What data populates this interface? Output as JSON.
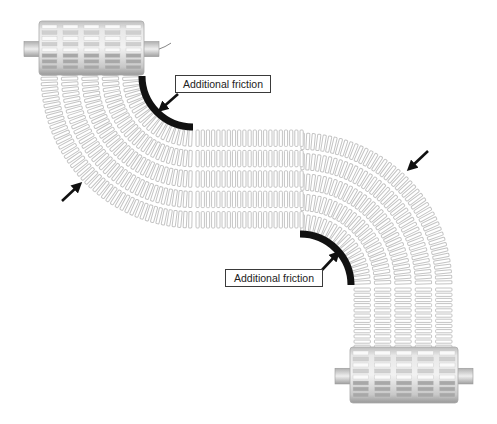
{
  "diagram": {
    "type": "curved modular conveyor belt (S-shape) with friction zones",
    "colors": {
      "background": "#ffffff",
      "link_stroke": "#c4c4c4",
      "friction_arc": "#111111",
      "arrow": "#111111",
      "roller_body": "#d9d9d9",
      "roller_dark": "#9a9a9a"
    },
    "labels": [
      {
        "id": "friction-label-top",
        "text": "Additional friction",
        "x": 175,
        "y": 75,
        "w": 96,
        "h": 18
      },
      {
        "id": "friction-label-bottom",
        "text": "Additional friction",
        "x": 225,
        "y": 269,
        "w": 98,
        "h": 18
      }
    ],
    "rollers": [
      {
        "id": "drive-roller-top",
        "x": 39,
        "y": 21,
        "w": 105,
        "h": 54,
        "wire": true
      },
      {
        "id": "idler-roller-bottom",
        "x": 350,
        "y": 347,
        "w": 108,
        "h": 56,
        "wire": false
      }
    ],
    "belt": {
      "rows": 5,
      "width": 102,
      "curve1_center": [
        193,
        76
      ],
      "curve2_center": [
        300,
        285
      ],
      "inner_radius": 52,
      "straight_x": [
        193,
        300
      ],
      "straight_y": [
        128,
        232
      ]
    },
    "friction_arcs": [
      {
        "center": [
          193,
          76
        ],
        "r": 51,
        "from_deg": 180,
        "to_deg": 90
      },
      {
        "center": [
          300,
          285
        ],
        "r": 51,
        "from_deg": 270,
        "to_deg": 360
      }
    ],
    "arrows": [
      {
        "id": "direction-arrow-left",
        "from": [
          62,
          201
        ],
        "to": [
          79,
          185
        ]
      },
      {
        "id": "direction-arrow-right",
        "from": [
          428,
          151
        ],
        "to": [
          410,
          168
        ]
      },
      {
        "id": "pointer-arrow-top",
        "from": [
          178,
          94
        ],
        "to": [
          161,
          109
        ]
      },
      {
        "id": "pointer-arrow-bottom",
        "from": [
          322,
          270
        ],
        "to": [
          337,
          254
        ]
      }
    ]
  }
}
